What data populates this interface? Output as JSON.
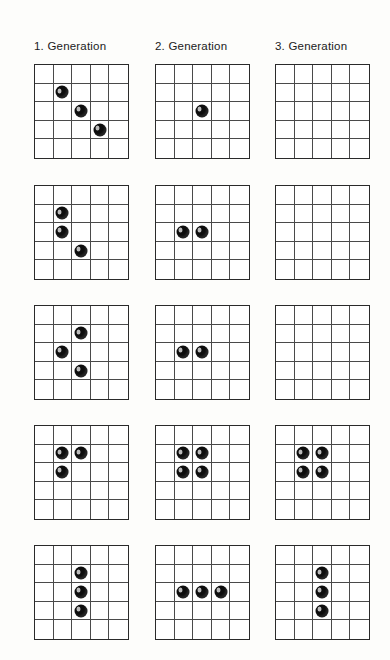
{
  "figure": {
    "kind": "game-of-life-generations",
    "grid": {
      "rows": 5,
      "cols": 5
    },
    "stone_color": "#0d0d0d",
    "grid_line_color": "#4a4a4a",
    "border_color": "#2a2a2a",
    "background_color": "#fdfdfb"
  },
  "columns": [
    {
      "id": "gen1",
      "label": "1. Generation"
    },
    {
      "id": "gen2",
      "label": "2. Generation"
    },
    {
      "id": "gen3",
      "label": "3. Generation"
    }
  ],
  "examples": [
    {
      "id": "example-1",
      "boards": [
        {
          "generation": 1,
          "live_cells": [
            [
              1,
              1
            ],
            [
              2,
              2
            ],
            [
              3,
              3
            ]
          ],
          "count": 3
        },
        {
          "generation": 2,
          "live_cells": [
            [
              2,
              2
            ]
          ],
          "count": 1
        },
        {
          "generation": 3,
          "live_cells": [],
          "count": 0
        }
      ]
    },
    {
      "id": "example-2",
      "boards": [
        {
          "generation": 1,
          "live_cells": [
            [
              1,
              1
            ],
            [
              2,
              1
            ],
            [
              3,
              2
            ]
          ],
          "count": 3
        },
        {
          "generation": 2,
          "live_cells": [
            [
              2,
              1
            ],
            [
              2,
              2
            ]
          ],
          "count": 2
        },
        {
          "generation": 3,
          "live_cells": [],
          "count": 0
        }
      ]
    },
    {
      "id": "example-3",
      "boards": [
        {
          "generation": 1,
          "live_cells": [
            [
              1,
              2
            ],
            [
              2,
              1
            ],
            [
              3,
              2
            ]
          ],
          "count": 3
        },
        {
          "generation": 2,
          "live_cells": [
            [
              2,
              1
            ],
            [
              2,
              2
            ]
          ],
          "count": 2
        },
        {
          "generation": 3,
          "live_cells": [],
          "count": 0
        }
      ]
    },
    {
      "id": "example-4",
      "boards": [
        {
          "generation": 1,
          "live_cells": [
            [
              1,
              1
            ],
            [
              1,
              2
            ],
            [
              2,
              1
            ]
          ],
          "count": 3
        },
        {
          "generation": 2,
          "live_cells": [
            [
              1,
              1
            ],
            [
              1,
              2
            ],
            [
              2,
              1
            ],
            [
              2,
              2
            ]
          ],
          "count": 4
        },
        {
          "generation": 3,
          "live_cells": [
            [
              1,
              1
            ],
            [
              1,
              2
            ],
            [
              2,
              1
            ],
            [
              2,
              2
            ]
          ],
          "count": 4
        }
      ]
    },
    {
      "id": "example-5",
      "boards": [
        {
          "generation": 1,
          "live_cells": [
            [
              1,
              2
            ],
            [
              2,
              2
            ],
            [
              3,
              2
            ]
          ],
          "count": 3
        },
        {
          "generation": 2,
          "live_cells": [
            [
              2,
              1
            ],
            [
              2,
              2
            ],
            [
              2,
              3
            ]
          ],
          "count": 3
        },
        {
          "generation": 3,
          "live_cells": [
            [
              1,
              2
            ],
            [
              2,
              2
            ],
            [
              3,
              2
            ]
          ],
          "count": 3
        }
      ]
    }
  ],
  "layout": {
    "column_x": [
      34,
      155,
      275
    ],
    "row_y": [
      64,
      185,
      305,
      425,
      545
    ],
    "board_size": 95,
    "header_y": 40
  }
}
